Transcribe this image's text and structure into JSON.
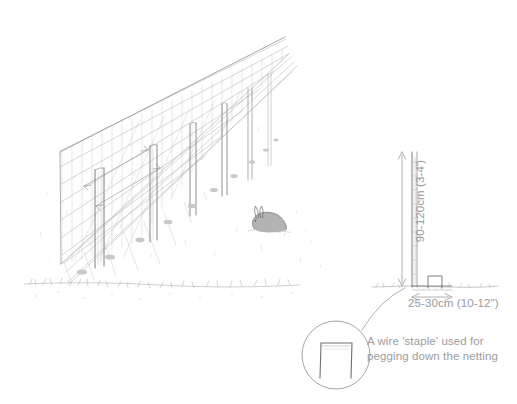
{
  "diagram": {
    "style": "pencil sketch",
    "background_color": "#ffffff",
    "ink_color": "#8a8a8a",
    "text_color": "#9a9a9a"
  },
  "scene": {
    "fence": {
      "name": "wire netting fence in perspective",
      "post_count": 6,
      "netting": "wire mesh",
      "skirt": "netting laid flat on ground and pegged"
    },
    "animal": {
      "name": "rabbit",
      "position": "right of fence on the ground"
    },
    "ground": {
      "name": "grass line with speckled texture"
    }
  },
  "elevation": {
    "name": "side elevation of fence post and buried skirt",
    "height_dimension": {
      "label": "90-120cm (3-4')",
      "orientation": "vertical"
    },
    "width_dimension": {
      "label": "25-30cm (10-12\")",
      "orientation": "horizontal"
    }
  },
  "detail": {
    "name": "magnified wire staple detail",
    "shape": "U-shaped wire staple",
    "caption_line_1": "A wire 'staple' used for",
    "caption_line_2": "pegging down the netting"
  }
}
